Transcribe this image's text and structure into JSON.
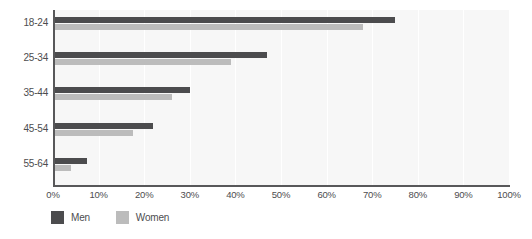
{
  "chart_data": {
    "type": "bar",
    "orientation": "horizontal",
    "title": "",
    "subtitle": "",
    "xlabel": "",
    "ylabel": "",
    "categories": [
      "18-24",
      "25-34",
      "35-44",
      "45-54",
      "55-64"
    ],
    "series": [
      {
        "name": "Men",
        "color": "#4c4c4e",
        "values": [
          75,
          47,
          30,
          22,
          7.5
        ]
      },
      {
        "name": "Women",
        "color": "#bcbcbc",
        "values": [
          68,
          39,
          26,
          17.5,
          4
        ]
      }
    ],
    "xlim": [
      0,
      100
    ],
    "xticks": [
      0,
      10,
      20,
      30,
      40,
      50,
      60,
      70,
      80,
      90,
      100
    ],
    "xtick_labels": [
      "0%",
      "10%",
      "20%",
      "30%",
      "40%",
      "50%",
      "60%",
      "70%",
      "80%",
      "90%",
      "100%"
    ],
    "value_suffix": "%",
    "grid": true,
    "grid_axis": "x",
    "grid_color": "#ffffff",
    "plot_background": "#f7f7f7",
    "axis_color": "#58585a",
    "legend_position": "bottom-left"
  },
  "legend": {
    "items": [
      {
        "label": "Men",
        "swatch_name": "legend-swatch-men",
        "color": "#4c4c4e"
      },
      {
        "label": "Women",
        "swatch_name": "legend-swatch-women",
        "color": "#bcbcbc"
      }
    ]
  }
}
